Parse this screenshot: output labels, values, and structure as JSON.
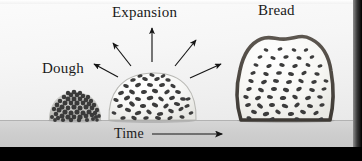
{
  "figure": {
    "type": "scientific-illustration",
    "palette": {
      "background_light": "#fbfbfb",
      "background_mid": "#ededed",
      "floor": "#d0d0d0",
      "ground_line": "#b2b2b2",
      "border_black": "#000000",
      "ink": "#1a1a1a",
      "crust": "#4a4540",
      "bubble": "#3c3c3c",
      "crumb_fill": "#f7f7f5"
    }
  },
  "labels": {
    "dough": "Dough",
    "expansion": "Expansion",
    "bread": "Bread",
    "time": "Time"
  },
  "stages": [
    {
      "name": "dough",
      "label": "Dough",
      "description": "small dense mound of dough made of many tiny dark granules",
      "bubble_count": 62,
      "center_x": 75,
      "baseline_y": 120
    },
    {
      "name": "expansion",
      "label": "Expansion",
      "description": "risen dome of dough with scattered elongated gas bubbles",
      "bubble_count": 64,
      "center_x": 152,
      "baseline_y": 120
    },
    {
      "name": "bread",
      "label": "Bread",
      "description": "baked loaf slice with dark crust outline and open crumb",
      "bubble_count": 58,
      "center_x": 286,
      "baseline_y": 120
    }
  ],
  "arrows": {
    "expansion_count": 5,
    "expansion_direction": "radiating outward from the rising dough",
    "time_direction": "left to right",
    "time_label": "Time"
  },
  "icons": {
    "arrow": "arrow-icon",
    "timeline_arrow": "timeline-arrow-icon"
  }
}
